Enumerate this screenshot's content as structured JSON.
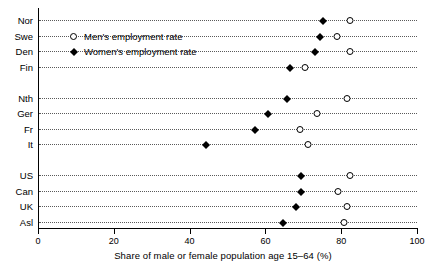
{
  "chart_data": {
    "type": "scatter",
    "title": "",
    "xlabel": "Share of male or female population age 15–64 (%)",
    "ylabel": "",
    "xlim": [
      0,
      100
    ],
    "xticks": [
      0,
      20,
      40,
      60,
      80,
      100
    ],
    "xtick_labels": [
      "0",
      "20",
      "40",
      "60",
      "80",
      "100"
    ],
    "grid": "horizontal-dotted",
    "legend_position": "upper-left-inside",
    "categories": [
      "Nor",
      "Swe",
      "Den",
      "Fin",
      "Nth",
      "Ger",
      "Fr",
      "It",
      "US",
      "Can",
      "UK",
      "Asl"
    ],
    "group_breaks_after": [
      "Fin",
      "It"
    ],
    "series": [
      {
        "name": "Men's employment rate",
        "marker": "open-circle",
        "color": "#000000",
        "values": [
          82.3,
          78.8,
          82.3,
          70.4,
          81.6,
          73.5,
          69.1,
          71.2,
          82.3,
          79.1,
          81.6,
          80.7
        ]
      },
      {
        "name": "Women's employment rate",
        "marker": "filled-diamond",
        "color": "#000000",
        "values": [
          75.1,
          74.4,
          73.1,
          66.5,
          65.6,
          60.7,
          57.3,
          44.3,
          69.3,
          69.3,
          68.1,
          64.7
        ]
      }
    ]
  },
  "legend": {
    "items": [
      {
        "label": "Men's employment rate",
        "marker": "open-circle"
      },
      {
        "label": "Women's employment rate",
        "marker": "filled-diamond"
      }
    ]
  },
  "axis": {
    "x_title": "Share of male or female population age 15–64 (%)",
    "tick_labels": [
      "0",
      "20",
      "40",
      "60",
      "80",
      "100"
    ]
  }
}
